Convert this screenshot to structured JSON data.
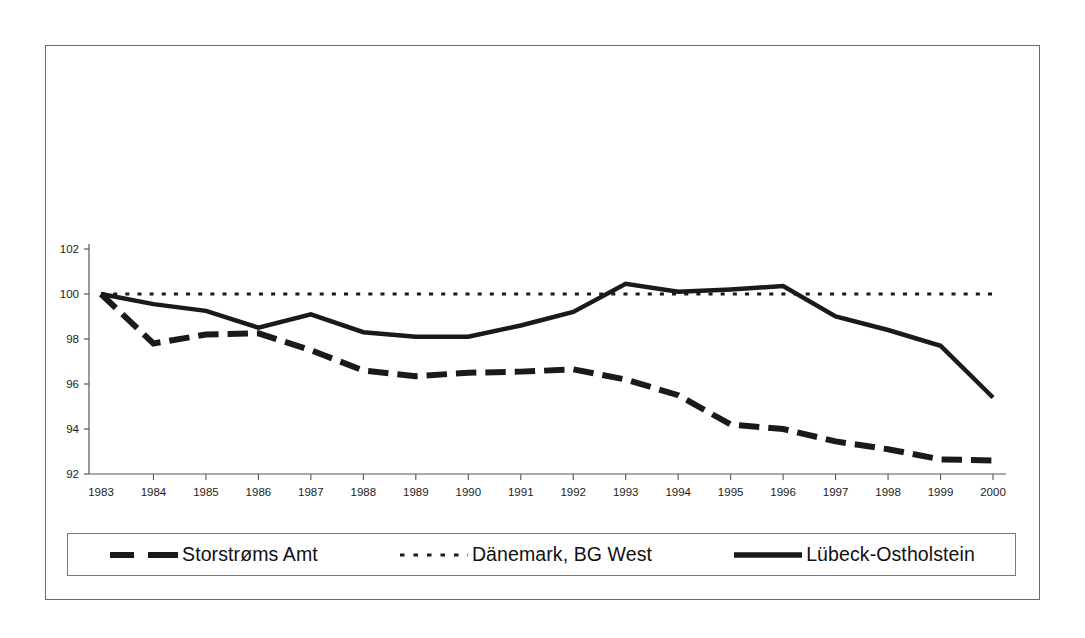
{
  "chart_data": {
    "type": "line",
    "title": "",
    "xlabel": "",
    "ylabel": "",
    "xlim": [
      1983,
      2000
    ],
    "ylim": [
      92,
      102
    ],
    "yticks": [
      92,
      94,
      96,
      98,
      100,
      102
    ],
    "grid": false,
    "legend_position": "bottom",
    "categories": [
      1983,
      1984,
      1985,
      1986,
      1987,
      1988,
      1989,
      1990,
      1991,
      1992,
      1993,
      1994,
      1995,
      1996,
      1997,
      1998,
      1999,
      2000
    ],
    "x_tick_labels": [
      "1983",
      "1984",
      "1985",
      "1986",
      "1987",
      "1988",
      "1989",
      "1990",
      "1991",
      "1992",
      "1993",
      "1994",
      "1995",
      "1996",
      "1997",
      "1998",
      "1999",
      "2000"
    ],
    "y_tick_labels": [
      "92",
      "94",
      "96",
      "98",
      "100",
      "102"
    ],
    "series": [
      {
        "name": "Storstrøms Amt",
        "style": "dashed",
        "color": "#1a1a1a",
        "width": 6,
        "values": [
          100.0,
          97.8,
          98.2,
          98.25,
          97.5,
          96.6,
          96.35,
          96.5,
          96.55,
          96.65,
          96.2,
          95.5,
          94.2,
          94.0,
          93.45,
          93.1,
          92.65,
          92.6
        ]
      },
      {
        "name": "Dänemark, BG West",
        "style": "dotted",
        "color": "#1a1a1a",
        "width": 3,
        "values": [
          100.0,
          100.0,
          100.0,
          100.0,
          100.0,
          100.0,
          100.0,
          100.0,
          100.0,
          100.0,
          100.0,
          100.0,
          100.0,
          100.0,
          100.0,
          100.0,
          100.0,
          100.0
        ]
      },
      {
        "name": "Lübeck-Ostholstein",
        "style": "solid",
        "color": "#1a1a1a",
        "width": 4.5,
        "values": [
          100.0,
          99.55,
          99.25,
          98.5,
          99.1,
          98.3,
          98.1,
          98.1,
          98.6,
          99.2,
          100.45,
          100.1,
          100.2,
          100.35,
          99.0,
          98.4,
          97.7,
          95.4
        ]
      }
    ]
  },
  "legend": {
    "items": [
      {
        "label": "Storstrøms Amt",
        "swatch": "dashed-thick-line"
      },
      {
        "label": "Dänemark, BG West",
        "swatch": "dotted-line"
      },
      {
        "label": "Lübeck-Ostholstein",
        "swatch": "solid-thick-line"
      }
    ]
  }
}
